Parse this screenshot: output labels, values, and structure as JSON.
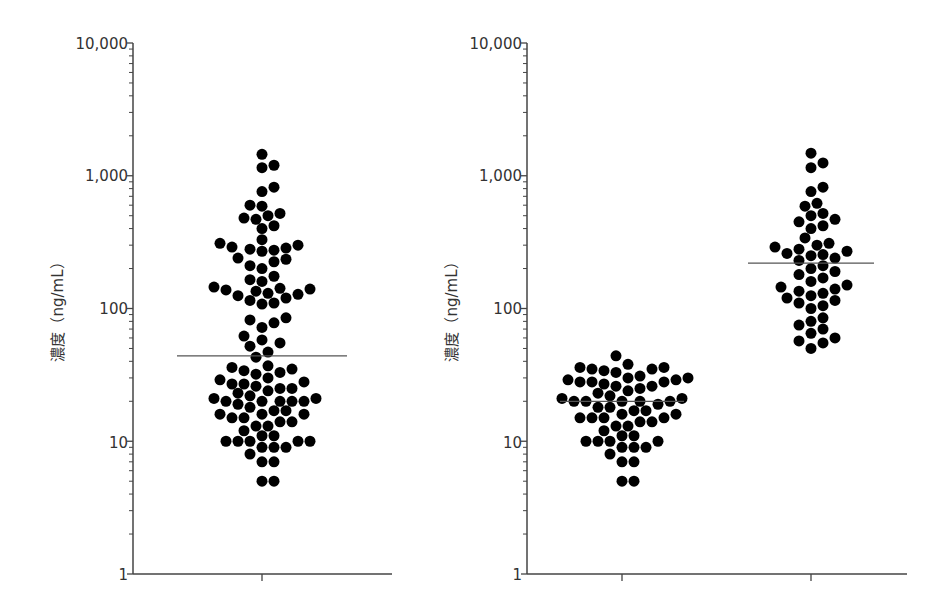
{
  "chart_data": [
    {
      "type": "scatter",
      "subtype": "dot-plot (beeswarm) with median line",
      "title": "",
      "xlabel": "",
      "ylabel": "濃度（ng/mL）",
      "yscale": "log",
      "ylim": [
        1,
        10000
      ],
      "ytick_labels": [
        "1",
        "10",
        "100",
        "1,000",
        "10,000"
      ],
      "yticks": [
        1,
        10,
        100,
        1000,
        10000
      ],
      "categories": [
        ""
      ],
      "grid": false,
      "legend": null,
      "series": [
        {
          "name": "all",
          "median": 44,
          "values": [
            1450,
            1200,
            1150,
            820,
            760,
            600,
            590,
            520,
            500,
            480,
            470,
            420,
            400,
            330,
            310,
            300,
            290,
            285,
            280,
            275,
            270,
            240,
            235,
            225,
            210,
            200,
            175,
            165,
            160,
            145,
            142,
            140,
            138,
            135,
            130,
            128,
            125,
            120,
            115,
            110,
            108,
            85,
            82,
            78,
            72,
            62,
            58,
            55,
            52,
            47,
            43,
            37,
            36,
            35,
            34,
            33,
            32,
            30,
            29,
            28,
            27,
            27,
            26,
            25,
            25,
            24,
            23,
            22,
            21,
            21,
            20,
            20,
            20,
            20,
            20,
            19,
            18,
            17,
            17,
            16,
            16,
            16,
            15,
            15,
            14,
            14,
            13,
            13,
            12,
            11,
            11,
            10,
            10,
            10,
            10,
            10,
            9,
            9,
            9,
            8,
            7,
            7,
            5,
            5
          ]
        }
      ]
    },
    {
      "type": "scatter",
      "subtype": "dot-plot (beeswarm) with median line",
      "title": "",
      "xlabel": "",
      "ylabel": "濃度（ng/mL）",
      "yscale": "log",
      "ylim": [
        1,
        10000
      ],
      "ytick_labels": [
        "1",
        "10",
        "100",
        "1,000",
        "10,000"
      ],
      "yticks": [
        1,
        10,
        100,
        1000,
        10000
      ],
      "categories": [
        "",
        ""
      ],
      "grid": false,
      "legend": null,
      "series": [
        {
          "name": "group-1",
          "median": 20,
          "values": [
            44,
            38,
            36,
            36,
            35,
            35,
            34,
            33,
            31,
            30,
            30,
            29,
            29,
            28,
            28,
            28,
            27,
            26,
            26,
            25,
            24,
            23,
            22,
            21,
            21,
            20,
            20,
            20,
            20,
            20,
            19,
            18,
            18,
            17,
            17,
            16,
            16,
            15,
            15,
            15,
            15,
            14,
            14,
            13,
            13,
            12,
            11,
            11,
            10,
            10,
            10,
            10,
            9,
            9,
            9,
            8,
            7,
            7,
            5,
            5
          ]
        },
        {
          "name": "group-2",
          "median": 220,
          "values": [
            1480,
            1250,
            1150,
            820,
            760,
            620,
            590,
            520,
            500,
            470,
            450,
            420,
            400,
            340,
            310,
            300,
            290,
            280,
            270,
            260,
            255,
            250,
            240,
            230,
            210,
            200,
            190,
            180,
            170,
            160,
            150,
            145,
            140,
            135,
            130,
            125,
            120,
            115,
            110,
            105,
            100,
            85,
            80,
            75,
            70,
            65,
            60,
            57,
            55,
            50
          ]
        }
      ]
    }
  ],
  "panels": [
    {
      "ylabel": "濃度（ng/mL）",
      "ytick_labels": [
        "10,000",
        "1,000",
        "100",
        "10",
        "1"
      ]
    },
    {
      "ylabel": "濃度（ng/mL）",
      "ytick_labels": [
        "10,000",
        "1,000",
        "100",
        "10",
        "1"
      ]
    }
  ],
  "colors": {
    "dot": "#000000",
    "axis": "#444444",
    "median": "#555555",
    "text": "#333333"
  }
}
